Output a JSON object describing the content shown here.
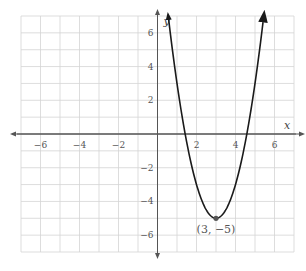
{
  "chart_data": {
    "type": "line",
    "title": "",
    "xlabel": "x",
    "ylabel": "y",
    "xlim": [
      -7,
      7
    ],
    "ylim": [
      -7,
      7
    ],
    "grid": true,
    "x_ticks": [
      -6,
      -4,
      -2,
      2,
      4,
      6
    ],
    "y_ticks": [
      6,
      4,
      2,
      -2,
      -4,
      -6
    ],
    "x_tick_labels": [
      "−6",
      "−4",
      "−2",
      "2",
      "4",
      "6"
    ],
    "y_tick_labels": [
      "6",
      "4",
      "2",
      "−2",
      "−4",
      "−6"
    ],
    "series": [
      {
        "name": "parabola",
        "equation": "y = 2(x − 3)² − 5",
        "a": 2,
        "h": 3,
        "k": -5,
        "arrows_at_ends": true
      }
    ],
    "annotations": [
      {
        "x": 3,
        "y": -5,
        "text": "(3, −5)",
        "marker": "point"
      }
    ]
  }
}
